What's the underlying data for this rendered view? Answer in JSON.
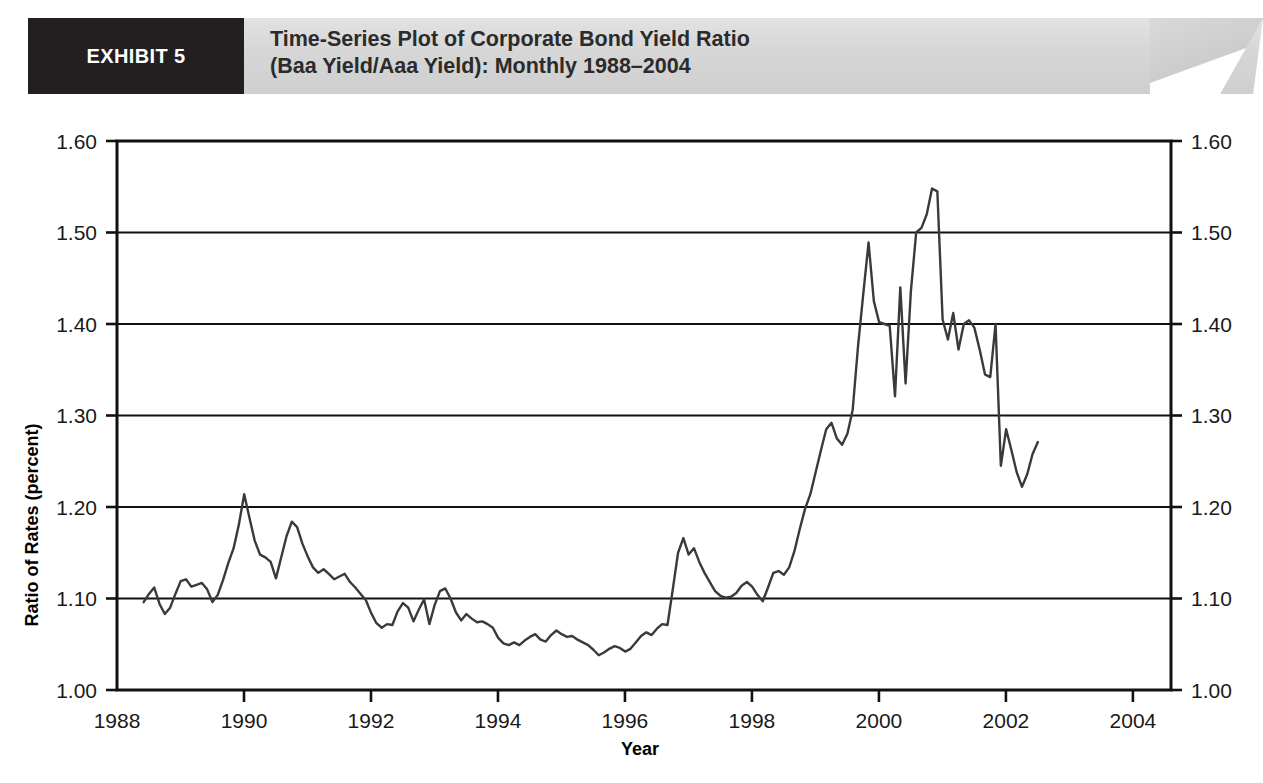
{
  "header": {
    "exhibit_tag": "EXHIBIT 5",
    "title_line1": "Time-Series Plot of Corporate Bond Yield Ratio",
    "title_line2": "(Baa Yield/Aaa Yield): Monthly 1988–2004",
    "tag_bg": "#231f20",
    "banner_bg": "#d8d8d8"
  },
  "chart_data": {
    "type": "line",
    "title": "Time-Series Plot of Corporate Bond Yield Ratio (Baa Yield/Aaa Yield): Monthly 1988–2004",
    "xlabel": "Year",
    "ylabel": "Ratio of Rates (percent)",
    "xlim": [
      1988.0,
      2004.6
    ],
    "ylim": [
      1.0,
      1.6
    ],
    "xticks": [
      1988,
      1990,
      1992,
      1994,
      1996,
      1998,
      2000,
      2002,
      2004
    ],
    "xtick_labels": [
      "1988",
      "1990",
      "1992",
      "1994",
      "1996",
      "1998",
      "2000",
      "2002",
      "2004"
    ],
    "yticks": [
      1.0,
      1.1,
      1.2,
      1.3,
      1.4,
      1.5,
      1.6
    ],
    "ytick_labels": [
      "1.00",
      "1.10",
      "1.20",
      "1.30",
      "1.40",
      "1.50",
      "1.60"
    ],
    "ytick_labels_right": [
      "1.00",
      "1.10",
      "1.20",
      "1.30",
      "1.40",
      "1.50",
      "1.60"
    ],
    "grid": "horizontal",
    "legend": "none",
    "line_color": "#3a3a3a",
    "line_width": 2.4,
    "series": [
      {
        "name": "Baa Yield / Aaa Yield",
        "x_start": 1988.42,
        "x_step": 0.0833333,
        "values": [
          1.096,
          1.105,
          1.112,
          1.094,
          1.083,
          1.09,
          1.105,
          1.119,
          1.121,
          1.113,
          1.115,
          1.117,
          1.11,
          1.096,
          1.104,
          1.12,
          1.139,
          1.155,
          1.181,
          1.214,
          1.188,
          1.163,
          1.148,
          1.145,
          1.14,
          1.122,
          1.145,
          1.168,
          1.184,
          1.178,
          1.16,
          1.146,
          1.134,
          1.128,
          1.132,
          1.127,
          1.121,
          1.124,
          1.127,
          1.118,
          1.112,
          1.105,
          1.098,
          1.084,
          1.073,
          1.068,
          1.072,
          1.071,
          1.086,
          1.095,
          1.09,
          1.075,
          1.088,
          1.099,
          1.072,
          1.093,
          1.108,
          1.111,
          1.1,
          1.085,
          1.076,
          1.083,
          1.078,
          1.074,
          1.075,
          1.072,
          1.068,
          1.057,
          1.051,
          1.049,
          1.052,
          1.049,
          1.054,
          1.058,
          1.061,
          1.055,
          1.053,
          1.06,
          1.065,
          1.061,
          1.058,
          1.059,
          1.055,
          1.052,
          1.049,
          1.044,
          1.038,
          1.041,
          1.045,
          1.048,
          1.046,
          1.042,
          1.045,
          1.052,
          1.059,
          1.063,
          1.06,
          1.067,
          1.072,
          1.071,
          1.11,
          1.15,
          1.166,
          1.148,
          1.155,
          1.14,
          1.128,
          1.118,
          1.108,
          1.103,
          1.101,
          1.102,
          1.106,
          1.114,
          1.118,
          1.113,
          1.104,
          1.097,
          1.112,
          1.128,
          1.13,
          1.126,
          1.134,
          1.152,
          1.176,
          1.198,
          1.214,
          1.238,
          1.262,
          1.285,
          1.292,
          1.275,
          1.268,
          1.28,
          1.306,
          1.375,
          1.433,
          1.489,
          1.425,
          1.402,
          1.4,
          1.398,
          1.321,
          1.44,
          1.335,
          1.436,
          1.5,
          1.505,
          1.52,
          1.548,
          1.545,
          1.405,
          1.383,
          1.412,
          1.372,
          1.4,
          1.404,
          1.396,
          1.372,
          1.345,
          1.342,
          1.4,
          1.245,
          1.285,
          1.262,
          1.238,
          1.222,
          1.236,
          1.258,
          1.271
        ],
        "min_value": 1.038,
        "max_value": 1.548
      }
    ],
    "annotations": []
  }
}
